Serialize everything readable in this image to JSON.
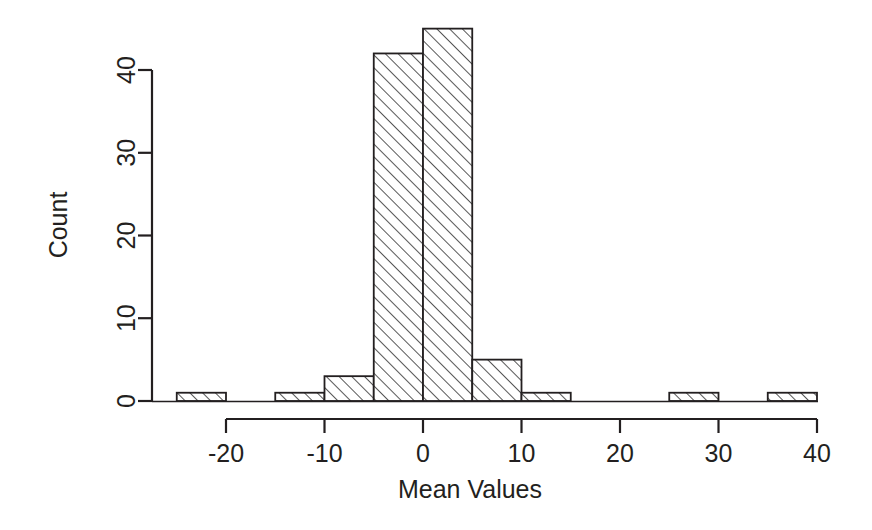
{
  "chart_data": {
    "type": "bar",
    "title": "",
    "subtitle": "",
    "xlabel": "Mean Values",
    "ylabel": "Count",
    "xlim": [
      -25,
      40
    ],
    "ylim": [
      0,
      45
    ],
    "grid": false,
    "legend": null,
    "bin_width": 5,
    "x_ticks": [
      -20,
      -10,
      0,
      10,
      20,
      30,
      40
    ],
    "x_tick_labels": [
      "-20",
      "-10",
      "0",
      "10",
      "20",
      "30",
      "40"
    ],
    "y_ticks": [
      0,
      10,
      20,
      30,
      40
    ],
    "y_tick_labels": [
      "0",
      "10",
      "20",
      "30",
      "40"
    ],
    "bin_edges": [
      -25,
      -20,
      -15,
      -10,
      -5,
      0,
      5,
      10,
      15,
      20,
      25,
      30,
      35,
      40
    ],
    "categories": [
      "-25 to -20",
      "-20 to -15",
      "-15 to -10",
      "-10 to -5",
      "-5 to 0",
      "0 to 5",
      "5 to 10",
      "10 to 15",
      "15 to 20",
      "20 to 25",
      "25 to 30",
      "30 to 35",
      "35 to 40"
    ],
    "values": [
      1,
      0,
      1,
      3,
      42,
      45,
      5,
      1,
      0,
      0,
      1,
      0,
      1
    ],
    "bar_fill": "hatched-diagonal",
    "bar_stroke": "#231f20",
    "background": "#ffffff"
  },
  "axes": {
    "x_title": "Mean Values",
    "y_title": "Count",
    "x_tick_labels": [
      "-20",
      "-10",
      "0",
      "10",
      "20",
      "30",
      "40"
    ],
    "y_tick_labels": [
      "0",
      "10",
      "20",
      "30",
      "40"
    ]
  }
}
